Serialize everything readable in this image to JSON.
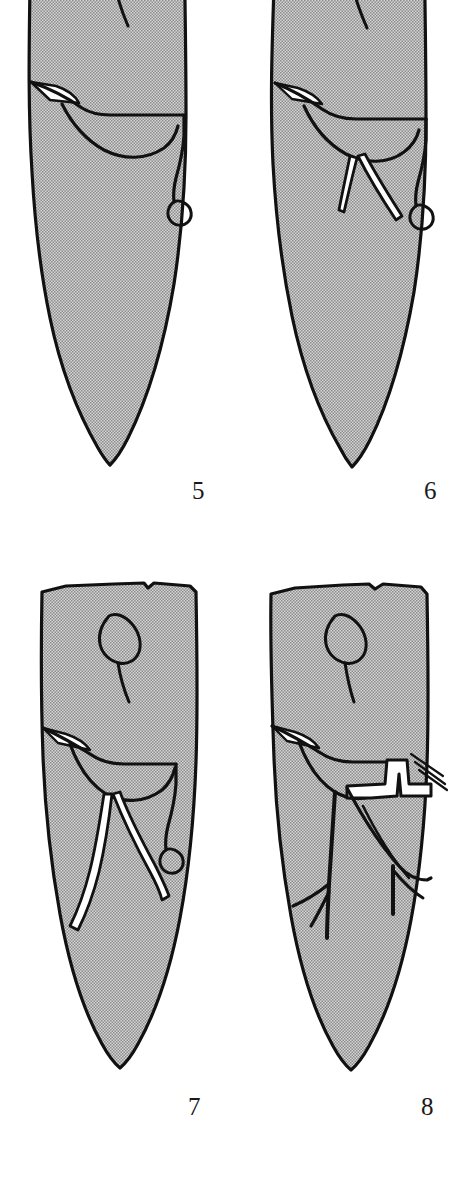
{
  "plate": {
    "background_color": "#ffffff",
    "ink_color": "#111111",
    "stipple_fill_color": "#c9c9c9",
    "stipple_dot_color": "#6e6e6e",
    "highlight_color": "#ffffff",
    "caption_color": "#1a1a1a",
    "description": "Four line drawings of engraved elongated blade-shaped artifacts with incised quadruped motifs"
  },
  "figures": [
    {
      "number": "5",
      "name": "engraved-point-5",
      "motif": "incised quadruped with lozenge head, single hind leg, curled tail",
      "outline": "elongated leaf-shaped blade, pointed base, cropped at top",
      "has_white_highlight": true,
      "leg_count": 1
    },
    {
      "number": "6",
      "name": "engraved-point-6",
      "motif": "incised quadruped with lozenge head, two splayed legs, curled tail",
      "outline": "elongated leaf-shaped blade, pointed base, cropped at top",
      "has_white_highlight": true,
      "leg_count": 2
    },
    {
      "number": "7",
      "name": "engraved-point-7",
      "motif": "incised quadruped with lozenge head, two long curving legs, curled tail",
      "outline": "elongated blade, flat notched top, pointed base",
      "has_white_highlight": true,
      "leg_count": 2
    },
    {
      "number": "8",
      "name": "engraved-point-8",
      "motif": "incised quadruped with lozenge head, branching legs, zig-zag chevron band and hatched rear field",
      "outline": "elongated blade, flat notched top, pointed base",
      "has_white_highlight": true,
      "leg_count": 2
    }
  ],
  "captions": {
    "fig5": "5",
    "fig6": "6",
    "fig7": "7",
    "fig8": "8"
  }
}
